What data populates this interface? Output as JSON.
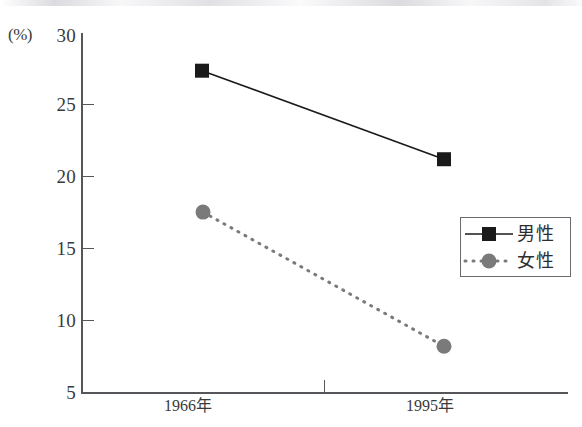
{
  "chart_data": {
    "type": "line",
    "title": "",
    "xlabel": "",
    "ylabel": "(%)",
    "categories": [
      "1966年",
      "1995年"
    ],
    "series": [
      {
        "name": "男性",
        "values": [
          27.5,
          21.3
        ],
        "color": "#1a1a1a",
        "line_style": "solid",
        "marker": "square"
      },
      {
        "name": "女性",
        "values": [
          17.6,
          8.2
        ],
        "color": "#7a7a7a",
        "line_style": "dotted",
        "marker": "circle"
      }
    ],
    "ylim": [
      5,
      30
    ],
    "yticks": [
      30,
      25,
      20,
      15,
      10,
      5
    ],
    "ytick_labels": [
      "30",
      "25",
      "20",
      "15",
      "10",
      "5"
    ],
    "grid": false,
    "legend_position": "center-right"
  },
  "axis": {
    "unit_label": "(%)",
    "y_labels": [
      "30",
      "25",
      "20",
      "15",
      "10",
      "5"
    ],
    "x_labels": [
      "1966年",
      "1995年"
    ]
  },
  "legend": {
    "items": [
      {
        "label": "男性"
      },
      {
        "label": "女性"
      }
    ]
  },
  "colors": {
    "male": "#1a1a1a",
    "female": "#7a7a7a",
    "axis": "#55555a",
    "legend_border": "#6a6a70",
    "background": "#ffffff"
  }
}
